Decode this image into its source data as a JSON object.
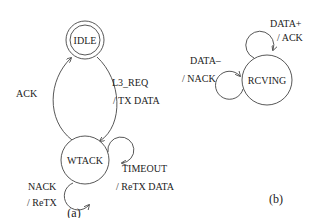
{
  "diagram_a": {
    "caption": "(a)",
    "states": {
      "idle": "IDLE",
      "wtack": "WTACK"
    },
    "transitions": {
      "ack": "ACK",
      "l3_req_event": "L3_REQ",
      "l3_req_action": "/ TX DATA",
      "timeout_event": "TIMEOUT",
      "timeout_action": "/ ReTX DATA",
      "nack_event": "NACK",
      "nack_action": "/ ReTX"
    }
  },
  "diagram_b": {
    "caption": "(b)",
    "states": {
      "rcving": "RCVING"
    },
    "transitions": {
      "data_plus_event": "DATA+",
      "data_plus_action": "/ ACK",
      "data_minus_event": "DATA–",
      "data_minus_action": "/ NACK"
    }
  }
}
